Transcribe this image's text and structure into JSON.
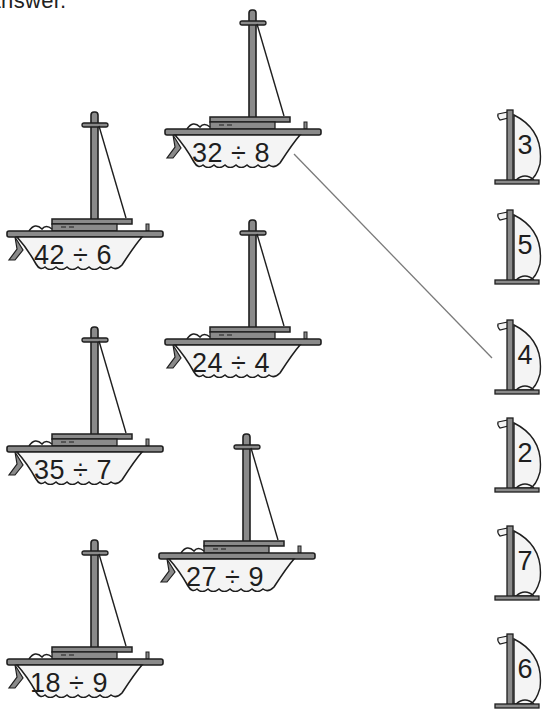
{
  "instruction_fragment": "er answer.",
  "colors": {
    "ink": "#1e1e1e",
    "hull_fill": "#f4f4f4",
    "gray": "#8a8a8a",
    "line": "#7a7a7a"
  },
  "problems": [
    {
      "id": "p1",
      "label": "32 ÷ 8",
      "left": 163,
      "top": 8,
      "text_left": 8,
      "text_top": 130
    },
    {
      "id": "p2",
      "label": "42 ÷ 6",
      "left": 5,
      "top": 110,
      "text_left": 8,
      "text_top": 130
    },
    {
      "id": "p3",
      "label": "24 ÷ 4",
      "left": 163,
      "top": 218,
      "text_left": 8,
      "text_top": 130
    },
    {
      "id": "p4",
      "label": "35 ÷ 7",
      "left": 5,
      "top": 325,
      "text_left": 8,
      "text_top": 130
    },
    {
      "id": "p5",
      "label": "27 ÷ 9",
      "left": 157,
      "top": 432,
      "text_left": 8,
      "text_top": 130
    },
    {
      "id": "p6",
      "label": "18 ÷ 9",
      "left": 5,
      "top": 538,
      "text_left": 4,
      "text_top": 130
    }
  ],
  "answers": [
    {
      "id": "a1",
      "value": "3",
      "top": 108
    },
    {
      "id": "a2",
      "value": "5",
      "top": 208
    },
    {
      "id": "a3",
      "value": "4",
      "top": 318
    },
    {
      "id": "a4",
      "value": "2",
      "top": 416
    },
    {
      "id": "a5",
      "value": "7",
      "top": 524
    },
    {
      "id": "a6",
      "value": "6",
      "top": 632
    }
  ],
  "matches": [
    {
      "from": "32 ÷ 8",
      "to": "4",
      "x1": 294,
      "y1": 154,
      "x2": 492,
      "y2": 358
    }
  ]
}
